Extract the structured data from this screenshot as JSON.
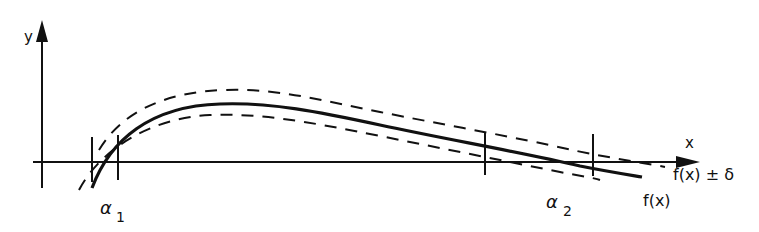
{
  "figure": {
    "axes": {
      "x_label": "x",
      "y_label": "y"
    },
    "labels": {
      "band": "f(x) ± δ",
      "curve": "f(x)",
      "root1_symbol": "α",
      "root1_sub": "1",
      "root2_symbol": "α",
      "root2_sub": "2"
    },
    "colors": {
      "ink": "#111111",
      "background": "#ffffff"
    }
  }
}
